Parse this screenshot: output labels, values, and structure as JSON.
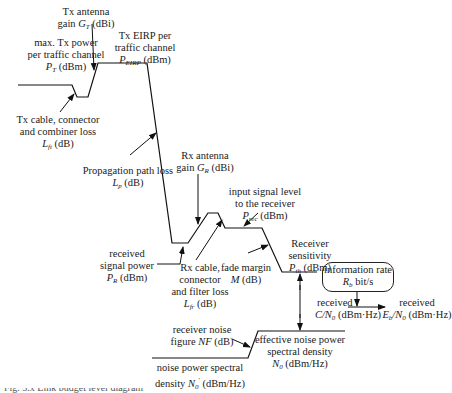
{
  "diagram": {
    "type": "link-budget level diagram",
    "labels": {
      "tx_power": {
        "line1": "max. Tx power",
        "line2": "per traffic channel",
        "sym": "P",
        "sub": "T",
        "unit": " (dBm)"
      },
      "tx_antenna": {
        "line1": "Tx antenna",
        "pre": "gain ",
        "sym": "G",
        "sub": "T",
        "unit": " (dBi)"
      },
      "tx_eirp": {
        "line1": "Tx EIRP per",
        "line2": "traffic channel",
        "sym": "P",
        "sub": "EIRP",
        "unit": " (dBm)"
      },
      "tx_loss": {
        "line1": "Tx cable, connector",
        "line2": "and combiner loss",
        "sym": "L",
        "sub": "ft",
        "unit": " (dB)"
      },
      "path_loss": {
        "line1": "Propagation path loss",
        "sym": "L",
        "sub": "p",
        "unit": " (dB)"
      },
      "rx_antenna": {
        "line1": "Rx antenna",
        "pre": "gain ",
        "sym": "G",
        "sub": "R",
        "unit": " (dBi)"
      },
      "rx_power": {
        "line1": "received",
        "line2": "signal power",
        "sym": "P",
        "sub": "R",
        "unit": " (dBm)"
      },
      "rx_loss": {
        "line1": "Rx cable,",
        "line2": "connector",
        "line3": "and filter loss",
        "sym": "L",
        "sub": "fr",
        "unit": " (dB)"
      },
      "input_level": {
        "line1": "input signal level",
        "line2": "to the receiver",
        "sym": "P",
        "sub": "rec",
        "unit": " (dBm)"
      },
      "fade_margin": {
        "line1": "fade margin",
        "sym": "M",
        "unit": " (dB)"
      },
      "sensitivity": {
        "line1": "Receiver",
        "line2": "sensitivity",
        "sym": "P",
        "sub": "th",
        "unit": " (dBm)"
      },
      "info_rate": {
        "line1": "information rate",
        "sym": "R",
        "sub": "b",
        "unit": " bit/s"
      },
      "cn0": {
        "line1": "received",
        "sym": "C/N",
        "sub": "0",
        "unit": " (dBm·Hz)"
      },
      "ebn0": {
        "line1": "received",
        "sym": "E",
        "sub": "b",
        "mid": "/N",
        "sub2": "0",
        "unit": " (dBm·Hz)"
      },
      "noise_figure": {
        "line1": "receiver noise",
        "pre": "figure ",
        "sym": "NF",
        "unit": " (dB)"
      },
      "eff_noise": {
        "line1": "effective noise power",
        "line2": "spectral density",
        "sym": "N",
        "sub": "0",
        "unit": " (dBm/Hz)"
      },
      "noise_psd": {
        "line1": "noise power spectral",
        "pre": "density ",
        "sym": "N",
        "sub": "0",
        "sup": "'",
        "unit": " (dBm/Hz)"
      }
    },
    "caption_fragment": "Fig. 5.x  Link budget level diagram"
  }
}
